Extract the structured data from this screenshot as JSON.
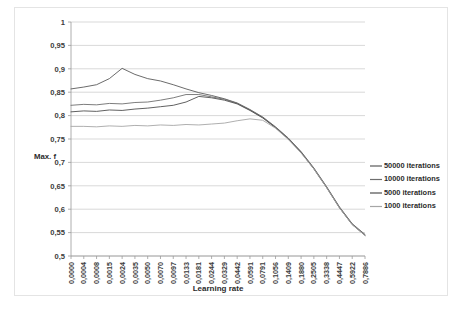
{
  "chart_data": {
    "type": "line",
    "title": "",
    "xlabel": "Learning rate",
    "ylabel": "Max. f",
    "ylim": [
      0.5,
      1.0
    ],
    "y_ticks": [
      "0,5",
      "0,55",
      "0,6",
      "0,65",
      "0,7",
      "0,75",
      "0,8",
      "0,85",
      "0,9",
      "0,95",
      "1"
    ],
    "y_tick_values": [
      0.5,
      0.55,
      0.6,
      0.65,
      0.7,
      0.75,
      0.8,
      0.85,
      0.9,
      0.95,
      1.0
    ],
    "grid": true,
    "legend_position": "right",
    "decimal_separator": ",",
    "x_tick_labels": [
      "0,0000",
      "0,0004",
      "0,0008",
      "0,0015",
      "0,0024",
      "0,0035",
      "0,0050",
      "0,0070",
      "0,0097",
      "0,0133",
      "0,0181",
      "0,0244",
      "0,0329",
      "0,0442",
      "0,0591",
      "0,0791",
      "0,1056",
      "0,1409",
      "0,1880",
      "0,2505",
      "0,3338",
      "0,4447",
      "0,5922",
      "0,7886"
    ],
    "categories": [
      0.0,
      0.0004,
      0.0008,
      0.0015,
      0.0024,
      0.0035,
      0.005,
      0.007,
      0.0097,
      0.0133,
      0.0181,
      0.0244,
      0.0329,
      0.0442,
      0.0591,
      0.0791,
      0.1056,
      0.1409,
      0.188,
      0.2505,
      0.3338,
      0.4447,
      0.5922,
      0.7886
    ],
    "series": [
      {
        "name": "50000 iterations",
        "color": "#5a5a5a",
        "values": [
          0.857,
          0.861,
          0.866,
          0.879,
          0.901,
          0.888,
          0.879,
          0.874,
          0.866,
          0.857,
          0.849,
          0.843,
          0.836,
          0.827,
          0.813,
          0.797,
          0.776,
          0.752,
          0.723,
          0.688,
          0.648,
          0.605,
          0.569,
          0.546
        ]
      },
      {
        "name": "10000 iterations",
        "color": "#6e6e6e",
        "values": [
          0.822,
          0.824,
          0.823,
          0.826,
          0.825,
          0.828,
          0.829,
          0.833,
          0.838,
          0.845,
          0.845,
          0.84,
          0.835,
          0.826,
          0.812,
          0.796,
          0.775,
          0.751,
          0.722,
          0.687,
          0.647,
          0.604,
          0.568,
          0.545
        ]
      },
      {
        "name": "5000 iterations",
        "color": "#4f4f4f",
        "values": [
          0.808,
          0.81,
          0.809,
          0.812,
          0.811,
          0.814,
          0.816,
          0.819,
          0.822,
          0.829,
          0.841,
          0.838,
          0.833,
          0.825,
          0.811,
          0.795,
          0.774,
          0.75,
          0.721,
          0.686,
          0.646,
          0.603,
          0.567,
          0.544
        ]
      },
      {
        "name": "1000 iterations",
        "color": "#a6a6a6",
        "values": [
          0.777,
          0.777,
          0.776,
          0.778,
          0.777,
          0.779,
          0.778,
          0.78,
          0.779,
          0.781,
          0.78,
          0.782,
          0.784,
          0.789,
          0.793,
          0.79,
          0.773,
          0.749,
          0.72,
          0.686,
          0.646,
          0.603,
          0.567,
          0.544
        ]
      }
    ]
  },
  "legend": {
    "items": [
      "50000 iterations",
      "10000 iterations",
      "5000 iterations",
      "1000 iterations"
    ]
  }
}
